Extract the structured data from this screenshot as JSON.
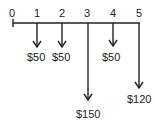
{
  "diagram": {
    "type": "cash-flow",
    "periods": [
      "0",
      "1",
      "2",
      "3",
      "4",
      "5"
    ],
    "cash_flows": [
      {
        "period": "1",
        "amount": "$50",
        "direction": "down"
      },
      {
        "period": "2",
        "amount": "$50",
        "direction": "down"
      },
      {
        "period": "3",
        "amount": "$150",
        "direction": "down"
      },
      {
        "period": "4",
        "amount": "$50",
        "direction": "down"
      },
      {
        "period": "5",
        "amount": "$120",
        "direction": "down"
      }
    ],
    "line_color": "#222222"
  }
}
